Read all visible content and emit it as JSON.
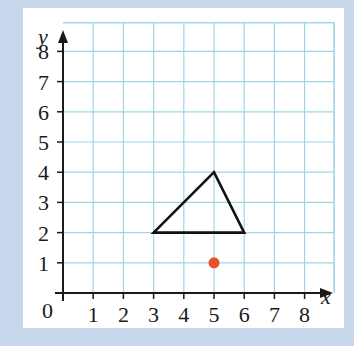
{
  "chart_data": {
    "type": "scatter",
    "title": "",
    "xlabel": "x",
    "ylabel": "y",
    "xlim": [
      0,
      9
    ],
    "ylim": [
      0,
      9
    ],
    "grid": true,
    "x_ticks": [
      "1",
      "2",
      "3",
      "4",
      "5",
      "6",
      "7",
      "8"
    ],
    "y_ticks": [
      "1",
      "2",
      "3",
      "4",
      "5",
      "6",
      "7",
      "8"
    ],
    "origin_label": "0",
    "shapes": [
      {
        "type": "triangle",
        "name": "triangle",
        "vertices": [
          [
            3,
            2
          ],
          [
            5,
            4
          ],
          [
            6,
            2
          ]
        ],
        "stroke": "#111111"
      }
    ],
    "points": [
      {
        "name": "red-point",
        "x": 5,
        "y": 1,
        "color": "#e8502a"
      }
    ]
  },
  "colors": {
    "background": "#c9d7ec",
    "panel": "#ffffff",
    "grid": "#9fd6e6",
    "axis": "#1a1a1a"
  }
}
